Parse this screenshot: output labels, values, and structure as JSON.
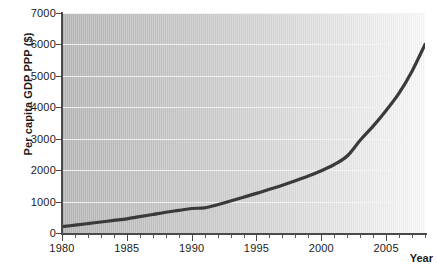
{
  "chart_data": {
    "type": "line",
    "title": "",
    "xlabel": "Year",
    "ylabel": "Per capita GDP PPP ($)",
    "xlim": [
      1980,
      2008
    ],
    "ylim": [
      0,
      7000
    ],
    "grid": "horizontal",
    "legend": "none",
    "line_color": "#3a3a3a",
    "plot_background": "#c8c8c8",
    "gridline_color": "#f3f3f3",
    "y_ticks": [
      0,
      1000,
      2000,
      3000,
      4000,
      5000,
      6000,
      7000
    ],
    "y_tick_labels": [
      "0",
      "1000",
      "2000",
      "3000",
      "4000",
      "5000",
      "6000",
      "7000"
    ],
    "x_ticks": [
      1980,
      1985,
      1990,
      1995,
      2000,
      2005
    ],
    "x_tick_labels": [
      "1980",
      "1985",
      "1990",
      "1995",
      "2000",
      "2005"
    ],
    "x_minor_tick_step": 1,
    "series": [
      {
        "name": "Per capita GDP PPP",
        "x": [
          1980,
          1981,
          1982,
          1983,
          1984,
          1985,
          1986,
          1987,
          1988,
          1989,
          1990,
          1991,
          1992,
          1993,
          1994,
          1995,
          1996,
          1997,
          1998,
          1999,
          2000,
          2001,
          2002,
          2003,
          2004,
          2005,
          2006,
          2007,
          2008
        ],
        "values": [
          200,
          250,
          300,
          350,
          400,
          450,
          520,
          590,
          660,
          720,
          780,
          800,
          900,
          1020,
          1140,
          1260,
          1390,
          1520,
          1660,
          1810,
          1980,
          2180,
          2450,
          2950,
          3400,
          3900,
          4450,
          5150,
          6000
        ]
      }
    ]
  }
}
